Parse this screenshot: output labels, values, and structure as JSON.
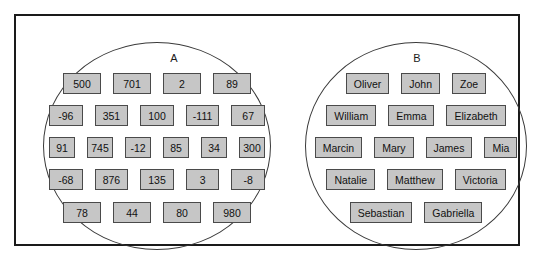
{
  "diagram": {
    "type": "venn-two-disjoint-sets",
    "sets": [
      {
        "id": "A",
        "label": "A",
        "kind": "numbers",
        "rows": [
          [
            "500",
            "701",
            "2",
            "89"
          ],
          [
            "-96",
            "351",
            "100",
            "-111",
            "67"
          ],
          [
            "91",
            "745",
            "-12",
            "85",
            "34",
            "300"
          ],
          [
            "-68",
            "876",
            "135",
            "3",
            "-8"
          ],
          [
            "78",
            "44",
            "80",
            "980"
          ]
        ]
      },
      {
        "id": "B",
        "label": "B",
        "kind": "names",
        "rows": [
          [
            "Oliver",
            "John",
            "Zoe"
          ],
          [
            "William",
            "Emma",
            "Elizabeth"
          ],
          [
            "Marcin",
            "Mary",
            "James",
            "Mia"
          ],
          [
            "Natalie",
            "Matthew",
            "Victoria"
          ],
          [
            "Sebastian",
            "Gabriella"
          ]
        ]
      }
    ]
  },
  "colors": {
    "frame_border": "#1a1a1a",
    "ellipse_border": "#3a3a3a",
    "tile_fill": "#c6c6c6",
    "tile_border": "#4a4a4a",
    "text": "#111111",
    "background": "#ffffff"
  }
}
